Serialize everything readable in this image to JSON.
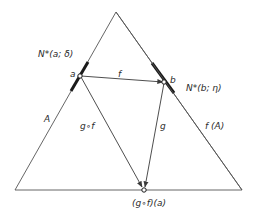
{
  "diagram": {
    "type": "commutative-mapping-diagram",
    "stroke_color": "#3a3a3a",
    "points": {
      "a": {
        "label": "a"
      },
      "b": {
        "label": "b"
      },
      "gfa": {
        "label": "(g∘f)(a)"
      }
    },
    "neighborhoods": {
      "a": {
        "label": "N*(a; δ)"
      },
      "b": {
        "label": "N*(b; η)"
      }
    },
    "arrows": {
      "f": {
        "label": "f",
        "from": "a",
        "to": "b"
      },
      "g": {
        "label": "g",
        "from": "b",
        "to": "(g∘f)(a)"
      },
      "gof": {
        "label": "g∘f",
        "from": "a",
        "to": "(g∘f)(a)"
      }
    },
    "regions": {
      "A": {
        "label": "A"
      },
      "fA": {
        "label": "f (A)"
      }
    }
  }
}
